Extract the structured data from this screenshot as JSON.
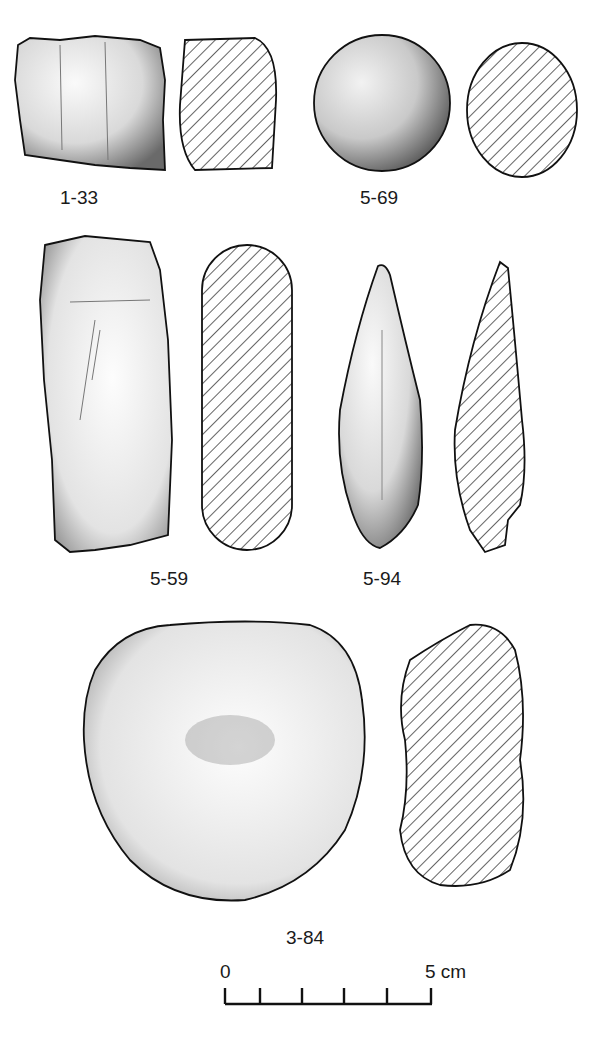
{
  "artifacts": [
    {
      "id": "1-33",
      "label": "1-33"
    },
    {
      "id": "5-69",
      "label": "5-69"
    },
    {
      "id": "5-59",
      "label": "5-59"
    },
    {
      "id": "5-94",
      "label": "5-94"
    },
    {
      "id": "3-84",
      "label": "3-84"
    }
  ],
  "scale_bar": {
    "start_label": "0",
    "end_label": "5 cm",
    "ticks": 5
  },
  "colors": {
    "ink": "#111111",
    "stipple": "#555555",
    "background": "#ffffff"
  }
}
